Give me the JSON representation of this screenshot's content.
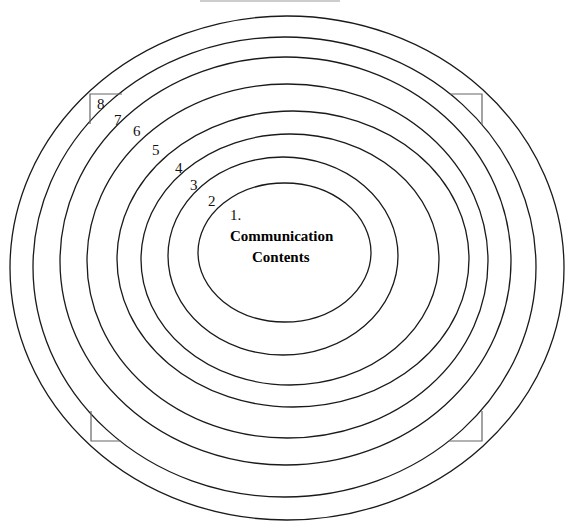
{
  "diagram": {
    "type": "concentric-layers",
    "center": {
      "number": "1.",
      "title_line1": "Communication",
      "title_line2": "Contents"
    },
    "layers": [
      {
        "index": 1,
        "label": "1."
      },
      {
        "index": 2,
        "label": "2"
      },
      {
        "index": 3,
        "label": "3"
      },
      {
        "index": 4,
        "label": "4"
      },
      {
        "index": 5,
        "label": "5"
      },
      {
        "index": 6,
        "label": "6"
      },
      {
        "index": 7,
        "label": "7"
      },
      {
        "index": 8,
        "label": "8"
      }
    ],
    "ring_count": 8,
    "corner_marks": [
      "top-left",
      "top-right",
      "bottom-left",
      "bottom-right"
    ],
    "colors": {
      "ring_stroke": "#1a1a1a",
      "corner_stroke": "#666666",
      "background": "#ffffff",
      "text": "#000000"
    }
  }
}
